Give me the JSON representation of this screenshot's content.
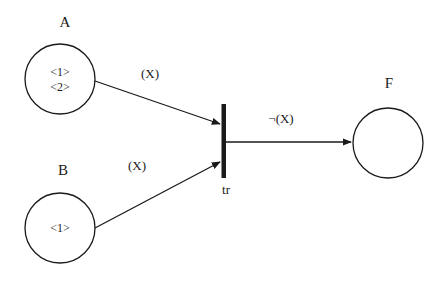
{
  "diagram": {
    "type": "petri-net",
    "colors": {
      "stroke": "#1a1a1a",
      "background": "#ffffff"
    },
    "places": [
      {
        "id": "A",
        "label": "A",
        "tokens": [
          "<1>",
          "<2>"
        ]
      },
      {
        "id": "B",
        "label": "B",
        "tokens": [
          "<1>"
        ]
      },
      {
        "id": "F",
        "label": "F",
        "tokens": []
      }
    ],
    "transitions": [
      {
        "id": "tr",
        "label": "tr"
      }
    ],
    "arcs": [
      {
        "from": "A",
        "to": "tr",
        "label": "(X)"
      },
      {
        "from": "B",
        "to": "tr",
        "label": "(X)"
      },
      {
        "from": "tr",
        "to": "F",
        "label": "¬(X)"
      }
    ]
  }
}
